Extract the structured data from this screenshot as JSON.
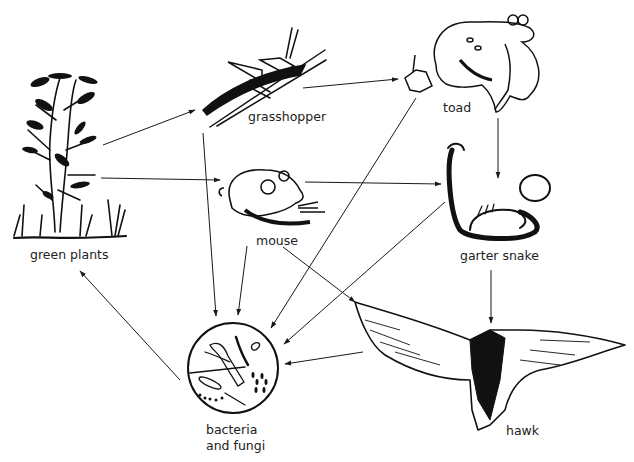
{
  "diagram": {
    "type": "food-web",
    "nodes": [
      {
        "id": "green-plants",
        "label": "green plants"
      },
      {
        "id": "grasshopper",
        "label": "grasshopper"
      },
      {
        "id": "toad",
        "label": "toad"
      },
      {
        "id": "mouse",
        "label": "mouse"
      },
      {
        "id": "garter-snake",
        "label": "garter snake"
      },
      {
        "id": "hawk",
        "label": "hawk"
      },
      {
        "id": "bacteria-fungi",
        "label_line1": "bacteria",
        "label_line2": "and fungi"
      }
    ],
    "edges": [
      {
        "from": "green-plants",
        "to": "grasshopper"
      },
      {
        "from": "green-plants",
        "to": "mouse"
      },
      {
        "from": "grasshopper",
        "to": "toad"
      },
      {
        "from": "toad",
        "to": "garter-snake"
      },
      {
        "from": "mouse",
        "to": "garter-snake"
      },
      {
        "from": "mouse",
        "to": "hawk"
      },
      {
        "from": "garter-snake",
        "to": "hawk"
      },
      {
        "from": "grasshopper",
        "to": "bacteria-fungi"
      },
      {
        "from": "mouse",
        "to": "bacteria-fungi"
      },
      {
        "from": "toad",
        "to": "bacteria-fungi"
      },
      {
        "from": "garter-snake",
        "to": "bacteria-fungi"
      },
      {
        "from": "hawk",
        "to": "bacteria-fungi"
      },
      {
        "from": "bacteria-fungi",
        "to": "green-plants"
      }
    ],
    "colors": {
      "ink": "#1a1a1a",
      "background": "#ffffff"
    }
  }
}
